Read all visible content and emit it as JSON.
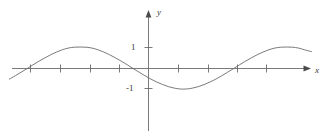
{
  "figure": {
    "name": "sine-curve-graph",
    "background_color": "#ffffff",
    "stroke_color": "#6b6b6b",
    "text_color": "#3a3a3a"
  },
  "axes": {
    "x_axis_label": "x",
    "y_axis_label": "y",
    "origin_px": [
      148,
      68
    ],
    "x_axis_y_px": 68,
    "y_axis_x_px": 148,
    "x_axis_start_px": 12,
    "x_axis_end_px": 311,
    "y_axis_top_px": 12,
    "y_axis_bottom_px": 131,
    "x_tick_positions_px": [
      30,
      60,
      90,
      119,
      178,
      208,
      237,
      266
    ],
    "y_tick_positions_px": [
      47,
      88
    ],
    "y_tick_labels": [
      "1",
      "-1"
    ],
    "tick_half_length_px": 4
  },
  "chart_data": {
    "type": "line",
    "title": "",
    "xlabel": "x",
    "ylabel": "y",
    "grid": false,
    "legend": null,
    "function": "y = sin(x)",
    "amplitude": 1,
    "period_px": 118,
    "xlim": [
      -2.35,
      2.77
    ],
    "ylim": [
      -1.45,
      2.4
    ],
    "ytick_values": [
      1,
      -1
    ],
    "ytick_labels": [
      "1",
      "-1"
    ],
    "xtick_values": [
      -2,
      -1.5,
      -1,
      -0.5,
      0.5,
      1,
      1.5,
      2
    ],
    "xtick_labels": [
      "",
      "",
      "",
      "",
      "",
      "",
      "",
      ""
    ],
    "zero_crossings_px": [
      30,
      90,
      148,
      208,
      266
    ],
    "peaks_px": [
      [
        60,
        47
      ],
      [
        178,
        47
      ]
    ],
    "troughs_px": [
      [
        119,
        88
      ],
      [
        237,
        88
      ]
    ],
    "x": [
      -2.35,
      -2.25,
      -2.15,
      -2.05,
      -1.95,
      -1.85,
      -1.75,
      -1.65,
      -1.55,
      -1.45,
      -1.35,
      -1.25,
      -1.15,
      -1.05,
      -0.95,
      -0.85,
      -0.75,
      -0.65,
      -0.55,
      -0.45,
      -0.35,
      -0.25,
      -0.15,
      -0.05,
      0.05,
      0.15,
      0.25,
      0.35,
      0.45,
      0.55,
      0.65,
      0.75,
      0.85,
      0.95,
      1.05,
      1.15,
      1.25,
      1.35,
      1.45,
      1.55,
      1.65,
      1.75,
      1.85,
      1.95,
      2.05,
      2.15,
      2.25,
      2.35,
      2.45,
      2.55,
      2.65,
      2.77
    ],
    "y": [
      -0.53,
      -0.37,
      -0.2,
      -0.03,
      0.15,
      0.32,
      0.48,
      0.63,
      0.76,
      0.87,
      0.95,
      0.99,
      1.0,
      0.99,
      0.95,
      0.87,
      0.76,
      0.63,
      0.48,
      0.32,
      0.15,
      -0.03,
      -0.2,
      -0.37,
      -0.53,
      -0.67,
      -0.79,
      -0.89,
      -0.96,
      -1.0,
      -1.0,
      -0.96,
      -0.89,
      -0.79,
      -0.67,
      -0.53,
      -0.37,
      -0.2,
      -0.03,
      0.15,
      0.32,
      0.48,
      0.63,
      0.76,
      0.87,
      0.95,
      0.99,
      1.0,
      0.99,
      0.95,
      0.87,
      0.78
    ]
  }
}
